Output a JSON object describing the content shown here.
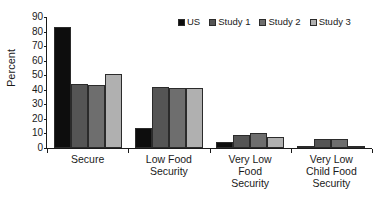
{
  "chart_data": {
    "type": "bar",
    "title": "",
    "subtitle": "",
    "xlabel": "",
    "ylabel": "Percent",
    "ylim": [
      0,
      90
    ],
    "yticks": [
      0,
      10,
      20,
      30,
      40,
      50,
      60,
      70,
      80,
      90
    ],
    "ytick_labels": [
      "0",
      "10",
      "20",
      "30",
      "40",
      "50",
      "60",
      "70",
      "80",
      "90"
    ],
    "grid": false,
    "legend_position": "top-right",
    "categories": [
      "Secure",
      "Low Food Security",
      "Very Low Food Security",
      "Very Low Child Food Security"
    ],
    "category_label_lines": [
      [
        "Secure"
      ],
      [
        "Low Food",
        "Security"
      ],
      [
        "Very Low",
        "Food",
        "Security"
      ],
      [
        "Very Low",
        "Child Food",
        "Security"
      ]
    ],
    "series": [
      {
        "name": "US",
        "color": "#0d0d0d",
        "values": [
          83,
          13.5,
          4,
          1.3
        ]
      },
      {
        "name": "Study 1",
        "color": "#555555",
        "values": [
          44,
          42,
          9,
          6
        ]
      },
      {
        "name": "Study 2",
        "color": "#6e6e6e",
        "values": [
          43,
          41.5,
          10.5,
          6.3
        ]
      },
      {
        "name": "Study 3",
        "color": "#b0b0b0",
        "values": [
          51,
          41.5,
          7.5,
          1.3
        ]
      }
    ],
    "bar_edge_color": "#2b2b2b",
    "axis_color": "#1a1a1a"
  }
}
